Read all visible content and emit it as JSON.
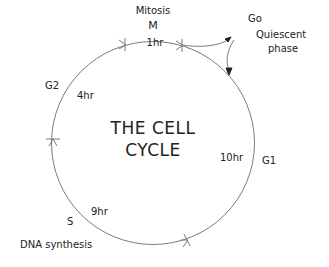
{
  "title": {
    "line1": "THE CELL",
    "line2": "CYCLE"
  },
  "phases": {
    "M": {
      "name": "Mitosis",
      "code": "M",
      "duration": "1hr"
    },
    "G1": {
      "code": "G1",
      "duration": "10hr"
    },
    "S": {
      "code": "S",
      "name": "DNA synthesis",
      "duration": "9hr"
    },
    "G2": {
      "code": "G2",
      "duration": "4hr"
    },
    "G0": {
      "code": "Go",
      "name_line1": "Quiescent",
      "name_line2": "phase"
    }
  },
  "colors": {
    "line": "#7a7a7a",
    "text": "#222222",
    "background": "#ffffff"
  }
}
